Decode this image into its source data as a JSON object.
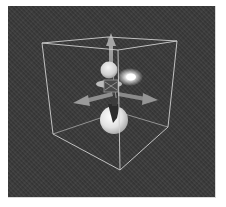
{
  "viewport": {
    "label": "3D viewport",
    "background_color": "#3a3a3a",
    "bounding_box": {
      "color": "#c8c8c8",
      "corners_top": [
        [
          42,
          43
        ],
        [
          108,
          37
        ],
        [
          177,
          41
        ],
        [
          118,
          50
        ]
      ],
      "corners_bottom": [
        [
          53,
          134
        ],
        [
          118,
          112
        ],
        [
          168,
          127
        ],
        [
          120,
          170
        ]
      ]
    },
    "gizmo": {
      "type": "move-gizmo",
      "arrow_color": "#9a9a9a",
      "arrows": [
        "up",
        "left",
        "right"
      ]
    },
    "objects": [
      {
        "name": "upper-sphere",
        "color": "#dddddd"
      },
      {
        "name": "lower-sphere",
        "color": "#e6e6e6"
      },
      {
        "name": "light-glow",
        "color": "#ffffff"
      }
    ]
  }
}
